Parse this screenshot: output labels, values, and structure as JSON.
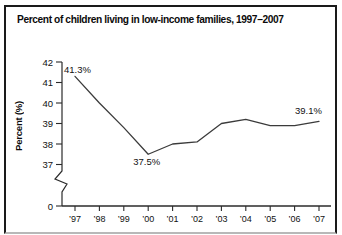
{
  "figure": {
    "title": "Percent of children living in low-income families, 1997–2007"
  },
  "chart_data": {
    "type": "line",
    "title": "Percent of children living in low-income families, 1997–2007",
    "xlabel": "",
    "ylabel": "Percent (%)",
    "categories": [
      "’97",
      "’98",
      "’99",
      "’00",
      "’01",
      "’02",
      "’03",
      "’04",
      "’05",
      "’06",
      "’07"
    ],
    "values": [
      41.3,
      40.0,
      38.8,
      37.5,
      38.0,
      38.1,
      39.0,
      39.2,
      38.9,
      38.9,
      39.1
    ],
    "y_ticks": [
      42,
      41,
      40,
      39,
      38,
      37
    ],
    "y_origin_label": "0",
    "ylim": [
      37,
      42
    ],
    "axis_break": true,
    "grid": false,
    "legend": "none",
    "annotations": [
      {
        "x_index": 0,
        "label": "41.3%",
        "dx": -11,
        "dy": -3
      },
      {
        "x_index": 3,
        "label": "37.5%",
        "dx": -15,
        "dy": 11
      },
      {
        "x_index": 10,
        "label": "39.1%",
        "dx": -24,
        "dy": -7
      }
    ]
  },
  "colors": {
    "background": "#ffffff",
    "frame_border": "#1a1a1a",
    "axis": "#2b2b2b",
    "line": "#3b3b3b",
    "text": "#111111"
  }
}
